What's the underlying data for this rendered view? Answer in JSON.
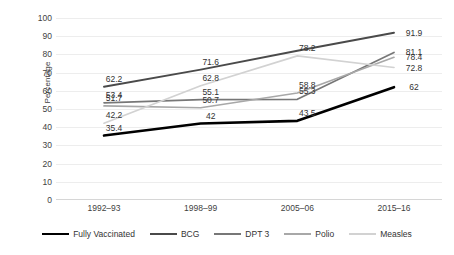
{
  "chart_data": {
    "type": "line",
    "title": "",
    "xlabel": "",
    "ylabel": "Percentage",
    "ylim": [
      0,
      100
    ],
    "ytick_step": 10,
    "yticks": [
      "0",
      "10",
      "20",
      "30",
      "40",
      "50",
      "60",
      "70",
      "80",
      "90",
      "100"
    ],
    "grid": true,
    "legend_position": "bottom",
    "categories": [
      "1992–93",
      "1998–99",
      "2005–06",
      "2015–16"
    ],
    "series": [
      {
        "name": "Fully Vaccinated",
        "color": "#000000",
        "width": 2.6,
        "values": [
          35.4,
          42,
          43.5,
          62
        ],
        "labels": [
          "35.4",
          "42",
          "43.5",
          "62"
        ]
      },
      {
        "name": "BCG",
        "color": "#4a4a4a",
        "width": 1.9,
        "values": [
          62.2,
          71.6,
          82.0,
          91.9
        ],
        "labels": [
          "62.2",
          "71.6",
          "",
          "91.9"
        ]
      },
      {
        "name": "DPT 3",
        "color": "#777777",
        "width": 1.7,
        "values": [
          53.4,
          55.1,
          55.3,
          81.1
        ],
        "labels": [
          "53.4",
          "55.1",
          "55.3",
          "81.1"
        ]
      },
      {
        "name": "Polio",
        "color": "#a8a8a8",
        "width": 1.7,
        "values": [
          51.7,
          50.7,
          58.8,
          78.4
        ],
        "labels": [
          "51.7",
          "50.7",
          "58.8",
          "78.4"
        ]
      },
      {
        "name": "Measles",
        "color": "#d2d2d2",
        "width": 1.7,
        "values": [
          42.2,
          62.8,
          79.2,
          72.8
        ],
        "labels": [
          "42.2",
          "62.8",
          "78.2",
          "72.8"
        ]
      }
    ]
  }
}
